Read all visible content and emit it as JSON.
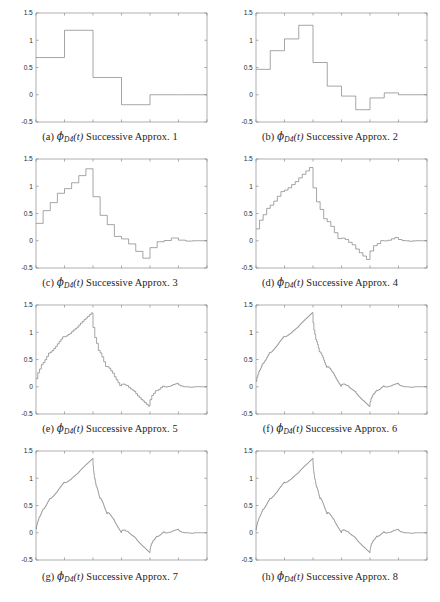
{
  "figure": {
    "name": "daubechies-d4-successive-approximations",
    "panel_count": 8,
    "columns": 2,
    "rows": 4
  },
  "axes": {
    "xlabel": "",
    "ylabel": "",
    "xlim": [
      0,
      3
    ],
    "ylim": [
      -0.5,
      1.5
    ],
    "xticks": [
      0,
      0.5,
      1,
      1.5,
      2,
      2.5,
      3
    ],
    "xticklabels": [
      "0",
      "0.5",
      "1",
      "1.5",
      "2",
      "2.5",
      "3"
    ],
    "yticks": [
      -0.5,
      0,
      0.5,
      1,
      1.5
    ],
    "yticklabels": [
      "-0.5",
      "0",
      "0.5",
      "1",
      "1.5"
    ],
    "grid": false,
    "box": true,
    "axis_color": "#8c8c8c",
    "curve_color": "#6e6e6e"
  },
  "panels": [
    {
      "id": "a",
      "tag": "(a)",
      "symbol": "ϕ",
      "subscript": "D4",
      "arg": "(t)",
      "text": "Successive Approx.",
      "iteration": "1",
      "caption_plain": "(a) ϕD4(t) Successive Approx. 1",
      "steps": 3,
      "style": "staircase"
    },
    {
      "id": "b",
      "tag": "(b)",
      "symbol": "ϕ",
      "subscript": "D4",
      "arg": "(t)",
      "text": "Successive Approx.",
      "iteration": "2",
      "caption_plain": "(b) ϕD4(t) Successive Approx. 2",
      "steps": 6,
      "style": "staircase"
    },
    {
      "id": "c",
      "tag": "(c)",
      "symbol": "ϕ",
      "subscript": "D4",
      "arg": "(t)",
      "text": "Successive Approx.",
      "iteration": "3",
      "caption_plain": "(c) ϕD4(t) Successive Approx. 3",
      "steps": 12,
      "style": "staircase"
    },
    {
      "id": "d",
      "tag": "(d)",
      "symbol": "ϕ",
      "subscript": "D4",
      "arg": "(t)",
      "text": "Successive Approx.",
      "iteration": "4",
      "caption_plain": "(d) ϕD4(t) Successive Approx. 4",
      "steps": 24,
      "style": "staircase"
    },
    {
      "id": "e",
      "tag": "(e)",
      "symbol": "ϕ",
      "subscript": "D4",
      "arg": "(t)",
      "text": "Successive Approx.",
      "iteration": "5",
      "caption_plain": "(e) ϕD4(t) Successive Approx. 5",
      "steps": 48,
      "style": "staircase"
    },
    {
      "id": "f",
      "tag": "(f)",
      "symbol": "ϕ",
      "subscript": "D4",
      "arg": "(t)",
      "text": "Successive Approx.",
      "iteration": "6",
      "caption_plain": "(f) ϕD4(t) Successive Approx. 6",
      "steps": 96,
      "style": "staircase"
    },
    {
      "id": "g",
      "tag": "(g)",
      "symbol": "ϕ",
      "subscript": "D4",
      "arg": "(t)",
      "text": "Successive Approx.",
      "iteration": "7",
      "caption_plain": "(g) ϕD4(t) Successive Approx. 7",
      "steps": 192,
      "style": "staircase"
    },
    {
      "id": "h",
      "tag": "(h)",
      "symbol": "ϕ",
      "subscript": "D4",
      "arg": "(t)",
      "text": "Successive Approx.",
      "iteration": "8",
      "caption_plain": "(h) ϕD4(t) Successive Approx. 8",
      "steps": 384,
      "style": "staircase"
    }
  ],
  "chart_data": {
    "type": "line",
    "title": "",
    "xlabel": "t",
    "ylabel": "",
    "xlim": [
      0,
      3
    ],
    "ylim": [
      -0.5,
      1.5
    ],
    "grid": false,
    "legend": "none",
    "filter_h": [
      0.4829629131445341,
      0.8365163037378079,
      0.2241438680420134,
      -0.1294095225512604
    ],
    "series": [
      {
        "name": "Successive Approx. 1",
        "panel": "a",
        "x": [
          0,
          0.5,
          0.5,
          1.0,
          1.0,
          1.5,
          1.5,
          2.0,
          2.0,
          2.5,
          2.5,
          3.0
        ],
        "values": [
          0.087,
          0.087,
          0.224,
          0.224,
          0.25,
          0.25,
          0.236,
          0.236,
          0.236,
          0.236,
          0.236,
          0.236
        ]
      },
      {
        "name": "Successive Approx. 2",
        "panel": "b",
        "x": [
          0,
          0.25,
          0.5,
          0.75,
          1.0,
          1.25,
          1.5,
          1.75,
          2.0,
          2.25,
          2.5,
          2.75,
          3.0
        ],
        "values": [
          0.04,
          0.04,
          0.12,
          0.22,
          0.32,
          0.42,
          0.46,
          0.47,
          0.48,
          0.47,
          0.43,
          0.38,
          0.19
        ]
      },
      {
        "name": "Successive Approx. 3",
        "panel": "c",
        "x": [
          0,
          0.25,
          0.5,
          0.75,
          1.0,
          1.25,
          1.5,
          1.75,
          2.0,
          2.25,
          2.5,
          2.75,
          3.0
        ],
        "values": [
          0.02,
          0.12,
          0.3,
          0.56,
          0.8,
          0.88,
          0.74,
          0.45,
          0.12,
          -0.03,
          -0.08,
          -0.08,
          -0.05
        ]
      },
      {
        "name": "Successive Approx. 4",
        "panel": "d",
        "x": [
          0,
          0.25,
          0.5,
          0.75,
          1.0,
          1.25,
          1.5,
          1.75,
          2.0,
          2.25,
          2.5,
          2.75,
          3.0
        ],
        "values": [
          0.0,
          0.16,
          0.45,
          0.78,
          1.08,
          0.96,
          0.6,
          0.22,
          -0.08,
          -0.16,
          -0.05,
          -0.01,
          0.0
        ]
      },
      {
        "name": "Successive Approx. 5",
        "panel": "e",
        "x": [
          0,
          0.25,
          0.5,
          0.75,
          1.0,
          1.25,
          1.5,
          1.75,
          2.0,
          2.25,
          2.5,
          2.75,
          3.0
        ],
        "values": [
          0.0,
          0.31,
          0.69,
          0.97,
          1.21,
          0.82,
          0.4,
          0.08,
          -0.24,
          -0.1,
          0.05,
          0.02,
          0.0
        ]
      },
      {
        "name": "Successive Approx. 6",
        "panel": "f",
        "x": [
          0,
          0.25,
          0.5,
          0.75,
          1.0,
          1.25,
          1.5,
          1.75,
          2.0,
          2.25,
          2.5,
          2.75,
          3.0
        ],
        "values": [
          0.0,
          0.45,
          0.86,
          1.06,
          1.3,
          0.64,
          0.25,
          0.0,
          -0.33,
          -0.06,
          0.06,
          0.01,
          0.0
        ]
      },
      {
        "name": "Successive Approx. 7",
        "panel": "g",
        "x": [
          0,
          0.25,
          0.5,
          0.75,
          1.0,
          1.25,
          1.5,
          1.75,
          2.0,
          2.25,
          2.5,
          2.75,
          3.0
        ],
        "values": [
          0.0,
          0.52,
          0.9,
          1.1,
          1.34,
          0.58,
          0.2,
          -0.04,
          -0.35,
          -0.04,
          0.06,
          0.01,
          0.0
        ]
      },
      {
        "name": "Successive Approx. 8",
        "panel": "h",
        "x": [
          0,
          0.25,
          0.5,
          0.75,
          1.0,
          1.25,
          1.5,
          1.75,
          2.0,
          2.25,
          2.5,
          2.75,
          3.0
        ],
        "values": [
          0.0,
          0.56,
          0.92,
          1.12,
          1.36,
          0.55,
          0.18,
          -0.06,
          -0.36,
          -0.03,
          0.06,
          0.01,
          0.0
        ]
      }
    ]
  }
}
